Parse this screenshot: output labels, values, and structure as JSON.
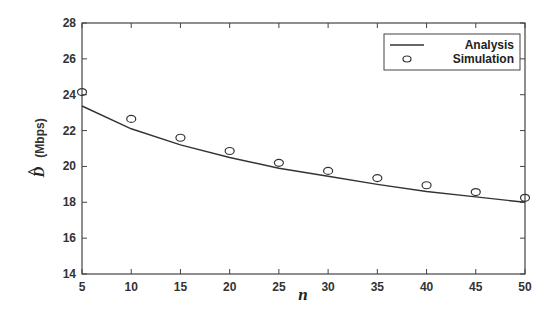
{
  "chart_data": {
    "type": "line",
    "title": "",
    "xlabel": "n",
    "ylabel": "D̂ (Mbps)",
    "ylabel_symbol": "D",
    "ylabel_unit": "(Mbps)",
    "x": [
      5,
      10,
      15,
      20,
      25,
      30,
      35,
      40,
      45,
      50
    ],
    "xlim": [
      5,
      50
    ],
    "ylim": [
      14,
      28
    ],
    "xticks": [
      5,
      10,
      15,
      20,
      25,
      30,
      35,
      40,
      45,
      50
    ],
    "yticks": [
      14,
      16,
      18,
      20,
      22,
      24,
      26,
      28
    ],
    "grid": false,
    "legend_position": "upper right",
    "series": [
      {
        "name": "Analysis",
        "style": "line",
        "color": "#333333",
        "values": [
          23.37,
          22.1,
          21.2,
          20.5,
          19.9,
          19.45,
          19.0,
          18.6,
          18.3,
          18.0
        ]
      },
      {
        "name": "Simulation",
        "style": "marker-circle",
        "color": "#333333",
        "values": [
          24.15,
          22.65,
          21.6,
          20.86,
          20.2,
          19.75,
          19.35,
          18.95,
          18.57,
          18.25
        ]
      }
    ]
  }
}
